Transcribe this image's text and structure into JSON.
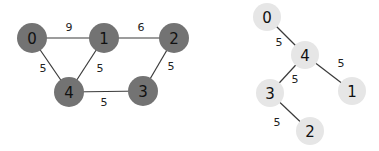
{
  "graphs": [
    {
      "name": "original-graph",
      "node_color": "#737373",
      "node_radius": 15,
      "nodes": [
        {
          "id": "0",
          "x": 32,
          "y": 38
        },
        {
          "id": "1",
          "x": 104,
          "y": 38
        },
        {
          "id": "2",
          "x": 174,
          "y": 38
        },
        {
          "id": "3",
          "x": 143,
          "y": 91
        },
        {
          "id": "4",
          "x": 69,
          "y": 92
        }
      ],
      "edges": [
        {
          "from": "0",
          "to": "1",
          "weight": "9",
          "lx": 69,
          "ly": 27
        },
        {
          "from": "1",
          "to": "2",
          "weight": "6",
          "lx": 141,
          "ly": 27
        },
        {
          "from": "0",
          "to": "4",
          "weight": "5",
          "lx": 43,
          "ly": 68
        },
        {
          "from": "1",
          "to": "4",
          "weight": "5",
          "lx": 100,
          "ly": 68
        },
        {
          "from": "2",
          "to": "3",
          "weight": "5",
          "lx": 171,
          "ly": 66
        },
        {
          "from": "4",
          "to": "3",
          "weight": "5",
          "lx": 104,
          "ly": 102
        }
      ]
    },
    {
      "name": "spanning-tree",
      "node_color": "#e6e6e6",
      "node_radius": 14,
      "nodes": [
        {
          "id": "0",
          "x": 267,
          "y": 17
        },
        {
          "id": "4",
          "x": 305,
          "y": 55
        },
        {
          "id": "1",
          "x": 352,
          "y": 91
        },
        {
          "id": "3",
          "x": 270,
          "y": 93
        },
        {
          "id": "2",
          "x": 310,
          "y": 131
        }
      ],
      "edges": [
        {
          "from": "0",
          "to": "4",
          "weight": "5",
          "lx": 279,
          "ly": 42
        },
        {
          "from": "4",
          "to": "1",
          "weight": "5",
          "lx": 341,
          "ly": 63
        },
        {
          "from": "4",
          "to": "3",
          "weight": "5",
          "lx": 295,
          "ly": 79
        },
        {
          "from": "3",
          "to": "2",
          "weight": "5",
          "lx": 277,
          "ly": 122
        }
      ]
    }
  ]
}
